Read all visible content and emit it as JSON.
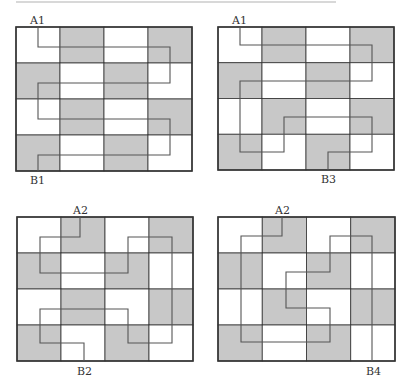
{
  "header": {
    "cropped_text": ""
  },
  "colors": {
    "shaded": "#c8c8c8",
    "white": "#ffffff",
    "border": "#333333",
    "path": "#555555"
  },
  "grid": {
    "rows": 4,
    "cols": 4,
    "pattern": [
      [
        0,
        1,
        0,
        1
      ],
      [
        1,
        0,
        1,
        0
      ],
      [
        0,
        1,
        0,
        1
      ],
      [
        1,
        0,
        1,
        0
      ]
    ]
  },
  "panels": [
    {
      "id": "panel-1",
      "start_label": "A1",
      "end_label": "B1",
      "box": {
        "x": 16,
        "y": 27,
        "w": 176,
        "h": 144
      },
      "start_pos": {
        "x": 30,
        "y": 15
      },
      "end_pos": {
        "x": 30,
        "y": 175
      },
      "path": [
        [
          38,
          27
        ],
        [
          38,
          47
        ],
        [
          170,
          47
        ],
        [
          170,
          83
        ],
        [
          38,
          83
        ],
        [
          38,
          119
        ],
        [
          170,
          119
        ],
        [
          170,
          155
        ],
        [
          38,
          155
        ],
        [
          38,
          171
        ]
      ]
    },
    {
      "id": "panel-2",
      "start_label": "A1",
      "end_label": "B3",
      "box": {
        "x": 218,
        "y": 27,
        "w": 176,
        "h": 143
      },
      "start_pos": {
        "x": 232,
        "y": 15
      },
      "end_pos": {
        "x": 321,
        "y": 174
      },
      "path": [
        [
          240,
          27
        ],
        [
          240,
          45
        ],
        [
          372,
          45
        ],
        [
          372,
          81
        ],
        [
          240,
          81
        ],
        [
          240,
          152
        ],
        [
          284,
          152
        ],
        [
          284,
          117
        ],
        [
          372,
          117
        ],
        [
          372,
          152
        ],
        [
          328,
          152
        ],
        [
          328,
          170
        ]
      ]
    },
    {
      "id": "panel-3",
      "start_label": "A2",
      "end_label": "B2",
      "box": {
        "x": 17,
        "y": 217,
        "w": 176,
        "h": 144
      },
      "start_pos": {
        "x": 73,
        "y": 205
      },
      "end_pos": {
        "x": 77,
        "y": 366
      },
      "path": [
        [
          80,
          217
        ],
        [
          80,
          237
        ],
        [
          40,
          237
        ],
        [
          40,
          273
        ],
        [
          128,
          273
        ],
        [
          128,
          237
        ],
        [
          172,
          237
        ],
        [
          172,
          343
        ],
        [
          128,
          343
        ],
        [
          128,
          309
        ],
        [
          40,
          309
        ],
        [
          40,
          343
        ],
        [
          84,
          343
        ],
        [
          84,
          361
        ]
      ]
    },
    {
      "id": "panel-4",
      "start_label": "A2",
      "end_label": "B4",
      "box": {
        "x": 218,
        "y": 217,
        "w": 177,
        "h": 144
      },
      "start_pos": {
        "x": 275,
        "y": 205
      },
      "end_pos": {
        "x": 366,
        "y": 366
      },
      "path": [
        [
          282,
          217
        ],
        [
          282,
          236
        ],
        [
          241,
          236
        ],
        [
          241,
          342
        ],
        [
          330,
          342
        ],
        [
          330,
          308
        ],
        [
          286,
          308
        ],
        [
          286,
          272
        ],
        [
          330,
          272
        ],
        [
          330,
          236
        ],
        [
          372,
          236
        ],
        [
          372,
          361
        ]
      ]
    }
  ]
}
